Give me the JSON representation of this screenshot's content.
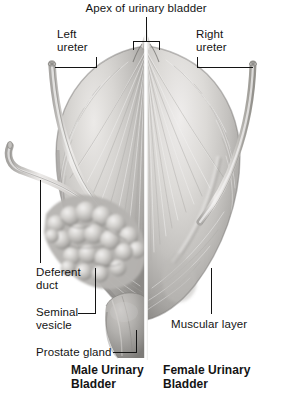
{
  "figure": {
    "title_left": "Male Urinary\nBladder",
    "title_right": "Female Urinary\nBladder",
    "background_color": "#ffffff",
    "text_color": "#141414",
    "leader_color": "#141414"
  },
  "labels": {
    "apex": "Apex of urinary bladder",
    "left_ureter": "Left\nureter",
    "right_ureter": "Right\nureter",
    "deferent_duct": "Deferent\nduct",
    "seminal_vesicle": "Seminal\nvesicle",
    "prostate_gland": "Prostate gland",
    "muscular_layer": "Muscular layer"
  },
  "structures": [
    {
      "name": "apex-of-urinary-bladder",
      "label": "Apex of urinary bladder",
      "side": "center"
    },
    {
      "name": "left-ureter",
      "label": "Left ureter",
      "side": "left"
    },
    {
      "name": "right-ureter",
      "label": "Right ureter",
      "side": "right"
    },
    {
      "name": "deferent-duct",
      "label": "Deferent duct",
      "side": "left"
    },
    {
      "name": "seminal-vesicle",
      "label": "Seminal vesicle",
      "side": "left"
    },
    {
      "name": "prostate-gland",
      "label": "Prostate gland",
      "side": "left"
    },
    {
      "name": "muscular-layer",
      "label": "Muscular layer",
      "side": "right"
    }
  ],
  "palette": {
    "tissue_light": "#e4e2e0",
    "tissue_mid": "#b9b7b4",
    "tissue_dark": "#8e8c89",
    "tissue_shadow": "#6e6c6a",
    "fiber_light": "#f0efee",
    "fiber_dark": "#9a9895",
    "divider": "#ffffff"
  }
}
